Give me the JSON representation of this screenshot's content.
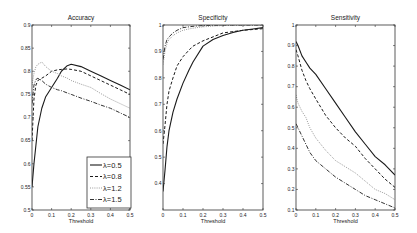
{
  "figure": {
    "xlabel": "Threshold"
  },
  "legend": {
    "entries": [
      "λ=0.5",
      "λ=0.8",
      "λ=1.2",
      "λ=1.5"
    ]
  },
  "styles": {
    "λ=0.5": {
      "dash": "",
      "width": 1.1,
      "color": "#1a1a1a"
    },
    "λ=0.8": {
      "dash": "3,2",
      "width": 1.0,
      "color": "#1a1a1a"
    },
    "λ=1.2": {
      "dash": "1,1.2",
      "width": 1.0,
      "color": "#9a9a9a"
    },
    "λ=1.5": {
      "dash": "4,1.5,1,1.5",
      "width": 1.0,
      "color": "#333333"
    }
  },
  "chart_data": [
    {
      "type": "line",
      "title": "Accuracy",
      "xlabel": "Threshold",
      "ylabel": "",
      "xlim": [
        0,
        0.5
      ],
      "ylim": [
        0.5,
        0.9
      ],
      "xticks": [
        0,
        0.1,
        0.2,
        0.3,
        0.4,
        0.5
      ],
      "xtick_labels": [
        "0",
        "0.1",
        "0.2",
        "0.3",
        "0.4",
        "0.5"
      ],
      "yticks": [
        0.5,
        0.55,
        0.6,
        0.65,
        0.7,
        0.75,
        0.8,
        0.85,
        0.9
      ],
      "ytick_labels": [
        "0.5",
        "0.55",
        "0.6",
        "0.65",
        "0.7",
        "0.75",
        "0.8",
        "0.85",
        "0.9"
      ],
      "grid": false,
      "legend_position": "lower right",
      "x": [
        0,
        0.01,
        0.02,
        0.03,
        0.05,
        0.07,
        0.1,
        0.13,
        0.15,
        0.18,
        0.2,
        0.25,
        0.3,
        0.35,
        0.4,
        0.45,
        0.5
      ],
      "series": [
        {
          "name": "λ=0.5",
          "values": [
            0.55,
            0.6,
            0.64,
            0.68,
            0.72,
            0.745,
            0.765,
            0.785,
            0.8,
            0.812,
            0.815,
            0.81,
            0.8,
            0.79,
            0.78,
            0.77,
            0.76
          ]
        },
        {
          "name": "λ=0.8",
          "values": [
            0.65,
            0.74,
            0.77,
            0.78,
            0.785,
            0.79,
            0.8,
            0.803,
            0.804,
            0.805,
            0.804,
            0.8,
            0.79,
            0.78,
            0.77,
            0.76,
            0.75
          ]
        },
        {
          "name": "λ=1.2",
          "values": [
            0.77,
            0.795,
            0.81,
            0.815,
            0.82,
            0.81,
            0.8,
            0.795,
            0.79,
            0.785,
            0.78,
            0.772,
            0.765,
            0.752,
            0.74,
            0.73,
            0.72
          ]
        },
        {
          "name": "λ=1.5",
          "values": [
            0.73,
            0.77,
            0.782,
            0.785,
            0.78,
            0.772,
            0.765,
            0.76,
            0.758,
            0.753,
            0.75,
            0.742,
            0.735,
            0.727,
            0.72,
            0.71,
            0.7
          ]
        }
      ]
    },
    {
      "type": "line",
      "title": "Specificity",
      "xlabel": "Threshold",
      "ylabel": "",
      "xlim": [
        0,
        0.5
      ],
      "ylim": [
        0.3,
        1.0
      ],
      "xticks": [
        0,
        0.1,
        0.2,
        0.3,
        0.4,
        0.5
      ],
      "xtick_labels": [
        "0",
        "0.1",
        "0.2",
        "0.3",
        "0.4",
        "0.5"
      ],
      "yticks": [
        0.4,
        0.5,
        0.6,
        0.7,
        0.8,
        0.9,
        1.0
      ],
      "ytick_labels": [
        "0.4",
        "0.5",
        "0.6",
        "0.7",
        "0.8",
        "0.9",
        "1"
      ],
      "grid": false,
      "x": [
        0,
        0.01,
        0.02,
        0.03,
        0.05,
        0.07,
        0.1,
        0.13,
        0.15,
        0.2,
        0.25,
        0.3,
        0.35,
        0.4,
        0.45,
        0.5
      ],
      "series": [
        {
          "name": "λ=0.5",
          "values": [
            0.37,
            0.45,
            0.54,
            0.6,
            0.67,
            0.72,
            0.78,
            0.83,
            0.86,
            0.92,
            0.945,
            0.96,
            0.972,
            0.98,
            0.985,
            0.99
          ]
        },
        {
          "name": "λ=0.8",
          "values": [
            0.55,
            0.62,
            0.7,
            0.75,
            0.8,
            0.845,
            0.88,
            0.905,
            0.92,
            0.94,
            0.955,
            0.97,
            0.975,
            0.98,
            0.983,
            0.986
          ]
        },
        {
          "name": "λ=1.2",
          "values": [
            0.85,
            0.9,
            0.93,
            0.945,
            0.96,
            0.97,
            0.98,
            0.985,
            0.988,
            0.993,
            0.996,
            0.998,
            0.999,
            1.0,
            1.0,
            1.0
          ]
        },
        {
          "name": "λ=1.5",
          "values": [
            0.87,
            0.92,
            0.945,
            0.955,
            0.97,
            0.98,
            0.99,
            0.993,
            0.995,
            0.998,
            0.999,
            1.0,
            1.0,
            1.0,
            1.0,
            1.0
          ]
        }
      ]
    },
    {
      "type": "line",
      "title": "Sensitivity",
      "xlabel": "Threshold",
      "ylabel": "",
      "xlim": [
        0,
        0.5
      ],
      "ylim": [
        0.1,
        1.0
      ],
      "xticks": [
        0,
        0.1,
        0.2,
        0.3,
        0.4,
        0.5
      ],
      "xtick_labels": [
        "0",
        "0.1",
        "0.2",
        "0.3",
        "0.4",
        "0.5"
      ],
      "yticks": [
        0.1,
        0.2,
        0.3,
        0.4,
        0.5,
        0.6,
        0.7,
        0.8,
        0.9,
        1.0
      ],
      "ytick_labels": [
        "0.1",
        "0.2",
        "0.3",
        "0.4",
        "0.5",
        "0.6",
        "0.7",
        "0.8",
        "0.9",
        "1"
      ],
      "grid": false,
      "x": [
        0,
        0.01,
        0.03,
        0.05,
        0.07,
        0.1,
        0.15,
        0.2,
        0.25,
        0.3,
        0.35,
        0.4,
        0.45,
        0.5
      ],
      "series": [
        {
          "name": "λ=0.5",
          "values": [
            0.92,
            0.9,
            0.85,
            0.82,
            0.79,
            0.76,
            0.69,
            0.62,
            0.55,
            0.48,
            0.42,
            0.36,
            0.32,
            0.27
          ]
        },
        {
          "name": "λ=0.8",
          "values": [
            0.88,
            0.85,
            0.78,
            0.73,
            0.69,
            0.64,
            0.56,
            0.5,
            0.45,
            0.41,
            0.35,
            0.3,
            0.25,
            0.21
          ]
        },
        {
          "name": "λ=1.2",
          "values": [
            0.66,
            0.62,
            0.58,
            0.55,
            0.5,
            0.45,
            0.39,
            0.34,
            0.31,
            0.28,
            0.24,
            0.2,
            0.18,
            0.15
          ]
        },
        {
          "name": "λ=1.5",
          "values": [
            0.52,
            0.5,
            0.46,
            0.42,
            0.38,
            0.34,
            0.3,
            0.26,
            0.23,
            0.2,
            0.17,
            0.15,
            0.13,
            0.11
          ]
        }
      ]
    }
  ]
}
